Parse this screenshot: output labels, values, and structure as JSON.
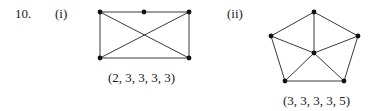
{
  "problem": {
    "number": "10.",
    "parts": [
      {
        "label": "(i)",
        "degree_sequence": "(2, 3, 3, 3, 3)",
        "graph": {
          "nodes": [
            {
              "id": "a",
              "x": 100,
              "y": 12
            },
            {
              "id": "b",
              "x": 144,
              "y": 12
            },
            {
              "id": "c",
              "x": 189,
              "y": 12
            },
            {
              "id": "d",
              "x": 100,
              "y": 58
            },
            {
              "id": "e",
              "x": 189,
              "y": 58
            }
          ],
          "edges": [
            [
              "a",
              "b"
            ],
            [
              "b",
              "c"
            ],
            [
              "a",
              "d"
            ],
            [
              "c",
              "e"
            ],
            [
              "d",
              "e"
            ],
            [
              "a",
              "e"
            ],
            [
              "c",
              "d"
            ]
          ]
        }
      },
      {
        "label": "(ii)",
        "degree_sequence": "(3, 3, 3, 3, 5)",
        "graph": {
          "nodes": [
            {
              "id": "t",
              "x": 314,
              "y": 12
            },
            {
              "id": "l",
              "x": 271,
              "y": 36
            },
            {
              "id": "r",
              "x": 358,
              "y": 36
            },
            {
              "id": "m",
              "x": 314,
              "y": 53
            },
            {
              "id": "bl",
              "x": 285,
              "y": 81
            },
            {
              "id": "br",
              "x": 344,
              "y": 81
            }
          ],
          "edges": [
            [
              "t",
              "l"
            ],
            [
              "t",
              "r"
            ],
            [
              "l",
              "bl"
            ],
            [
              "r",
              "br"
            ],
            [
              "bl",
              "br"
            ],
            [
              "t",
              "m"
            ],
            [
              "l",
              "m"
            ],
            [
              "r",
              "m"
            ],
            [
              "bl",
              "m"
            ],
            [
              "br",
              "m"
            ]
          ]
        }
      }
    ]
  }
}
